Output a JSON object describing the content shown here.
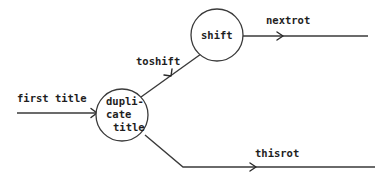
{
  "diagram": {
    "type": "data-flow",
    "nodes": [
      {
        "id": "duplicate_title",
        "lines": [
          "dupli-",
          "cate",
          "title"
        ]
      },
      {
        "id": "shift",
        "lines": [
          "shift"
        ]
      }
    ],
    "edges": [
      {
        "id": "first_title",
        "label": "first title",
        "from": "external",
        "to": "duplicate_title"
      },
      {
        "id": "toshift",
        "label": "toshift",
        "from": "duplicate_title",
        "to": "shift"
      },
      {
        "id": "nextrot",
        "label": "nextrot",
        "from": "shift",
        "to": "external"
      },
      {
        "id": "thisrot",
        "label": "thisrot",
        "from": "duplicate_title",
        "to": "external"
      }
    ],
    "colors": {
      "line": "#3a3a3a",
      "text": "#1e1e1e",
      "background": "#ffffff"
    }
  }
}
